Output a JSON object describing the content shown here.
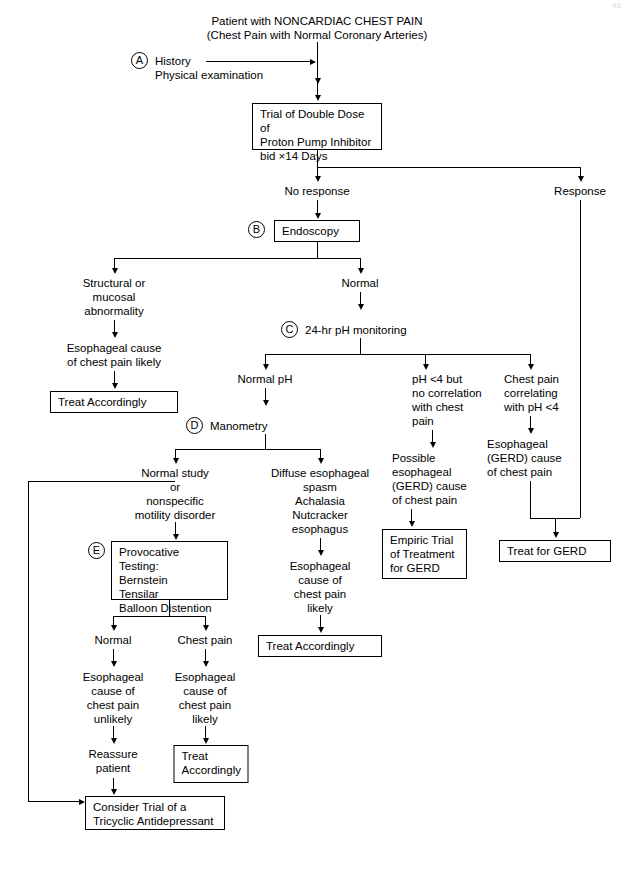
{
  "diagram": {
    "title_line1": "Patient with NONCARDIAC CHEST PAIN",
    "title_line2": "(Chest Pain with Normal Coronary Arteries)",
    "page_mark": "43"
  },
  "steps": {
    "a_letter": "A",
    "b_letter": "B",
    "c_letter": "C",
    "d_letter": "D",
    "e_letter": "E"
  },
  "nodes": {
    "history": "History\nPhysical examination",
    "ppi_trial": "Trial of Double Dose of\nProton Pump Inhibitor\nbid ×14 Days",
    "no_response": "No response",
    "response": "Response",
    "endoscopy": "Endoscopy",
    "structural": "Structural or\nmucosal\nabnormality",
    "esoph_cause_likely_left": "Esophageal cause\nof chest pain likely",
    "treat_accordingly_left": "Treat Accordingly",
    "normal": "Normal",
    "ph_monitoring": "24-hr pH monitoring",
    "normal_ph": "Normal pH",
    "manometry": "Manometry",
    "ph_less4_no_corr": "pH <4 but\nno correlation\nwith chest\npain",
    "possible_gerd": "Possible\nesophageal\n(GERD) cause\nof chest pain",
    "empiric_trial": "Empiric Trial\nof Treatment\nfor GERD",
    "chest_pain_correlating": "Chest pain\ncorrelating\nwith pH <4",
    "esoph_gerd_cause": "Esophageal\n(GERD) cause\nof chest pain",
    "treat_for_gerd": "Treat for GERD",
    "normal_study": "Normal study\nor\nnonspecific\nmotility disorder",
    "diffuse_spasm": "Diffuse esophageal\nspasm\nAchalasia\nNutcracker\nesophagus",
    "esoph_cause_likely_mid": "Esophageal\ncause of\nchest pain\nlikely",
    "treat_accordingly_mid": "Treat Accordingly",
    "provocative_testing": "Provocative Testing:\n   Bernstein\n   Tensilar\n   Balloon Distention",
    "prov_normal": "Normal",
    "prov_chest_pain": "Chest pain",
    "esoph_cause_unlikely": "Esophageal\ncause of\nchest pain\nunlikely",
    "esoph_cause_likely_prov": "Esophageal\ncause of\nchest pain\nlikely",
    "reassure_patient": "Reassure\npatient",
    "treat_accordingly_prov": "Treat\nAccordingly",
    "tricyclic": "Consider Trial of a\nTricyclic Antidepressant"
  },
  "colors": {
    "line": "#000000",
    "background": "#ffffff",
    "text": "#000000"
  }
}
